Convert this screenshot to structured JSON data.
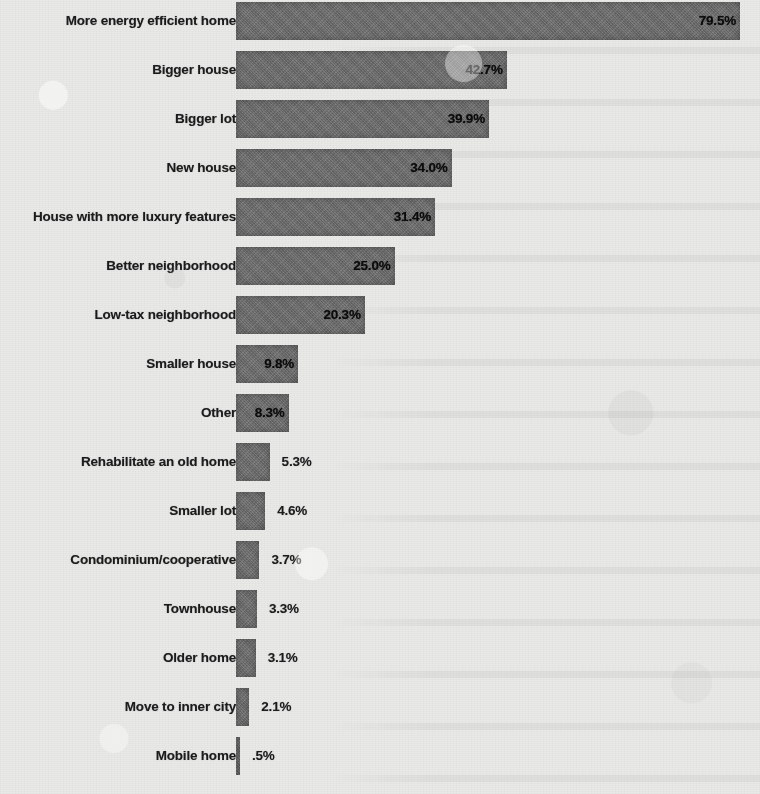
{
  "chart_data": {
    "type": "bar",
    "orientation": "horizontal",
    "title": "",
    "subtitle": "",
    "xlabel": "",
    "ylabel": "",
    "grid": false,
    "legend": null,
    "axis_visible": false,
    "value_suffix": "%",
    "xlim": [
      0,
      86
    ],
    "categories": [
      "More energy efficient home",
      "Bigger house",
      "Bigger lot",
      "New house",
      "House with more luxury features",
      "Better neighborhood",
      "Low-tax neighborhood",
      "Smaller house",
      "Other",
      "Rehabilitate an old home",
      "Smaller lot",
      "Condominium/cooperative",
      "Townhouse",
      "Older home",
      "Move to inner city",
      "Mobile home"
    ],
    "values": [
      79.5,
      42.7,
      39.9,
      34.0,
      31.4,
      25.0,
      20.3,
      9.8,
      8.3,
      5.3,
      4.6,
      3.7,
      3.3,
      3.1,
      2.1,
      0.5
    ],
    "value_labels": [
      "79.5%",
      "42.7%",
      "39.9%",
      "34.0%",
      "31.4%",
      "25.0%",
      "20.3%",
      "9.8%",
      "8.3%",
      "5.3%",
      "4.6%",
      "3.7%",
      "3.3%",
      "3.1%",
      "2.1%",
      ".5%"
    ],
    "label_placement": [
      "inside",
      "inside",
      "inside",
      "inside",
      "inside",
      "inside",
      "inside",
      "inside",
      "inside",
      "outside",
      "outside",
      "outside",
      "outside",
      "outside",
      "outside",
      "outside"
    ],
    "colors": {
      "bar_fill": "#6e6e6e",
      "background": "#e9e9e7",
      "label_text": "#1d1d1d",
      "value_text": "#0d0d0d"
    }
  },
  "rows": [
    {
      "label": "More energy efficient home",
      "value": 79.5,
      "value_label": "79.5%",
      "placement": "inside"
    },
    {
      "label": "Bigger house",
      "value": 42.7,
      "value_label": "42.7%",
      "placement": "inside"
    },
    {
      "label": "Bigger lot",
      "value": 39.9,
      "value_label": "39.9%",
      "placement": "inside"
    },
    {
      "label": "New house",
      "value": 34.0,
      "value_label": "34.0%",
      "placement": "inside"
    },
    {
      "label": "House with more luxury features",
      "value": 31.4,
      "value_label": "31.4%",
      "placement": "inside"
    },
    {
      "label": "Better neighborhood",
      "value": 25.0,
      "value_label": "25.0%",
      "placement": "inside"
    },
    {
      "label": "Low-tax neighborhood",
      "value": 20.3,
      "value_label": "20.3%",
      "placement": "inside"
    },
    {
      "label": "Smaller house",
      "value": 9.8,
      "value_label": "9.8%",
      "placement": "inside"
    },
    {
      "label": "Other",
      "value": 8.3,
      "value_label": "8.3%",
      "placement": "inside"
    },
    {
      "label": "Rehabilitate an old home",
      "value": 5.3,
      "value_label": "5.3%",
      "placement": "outside"
    },
    {
      "label": "Smaller lot",
      "value": 4.6,
      "value_label": "4.6%",
      "placement": "outside"
    },
    {
      "label": "Condominium/cooperative",
      "value": 3.7,
      "value_label": "3.7%",
      "placement": "outside"
    },
    {
      "label": "Townhouse",
      "value": 3.3,
      "value_label": "3.3%",
      "placement": "outside"
    },
    {
      "label": "Older home",
      "value": 3.1,
      "value_label": "3.1%",
      "placement": "outside"
    },
    {
      "label": "Move to inner city",
      "value": 2.1,
      "value_label": "2.1%",
      "placement": "outside"
    },
    {
      "label": "Mobile home",
      "value": 0.5,
      "value_label": ".5%",
      "placement": "outside"
    }
  ],
  "layout": {
    "bar_origin_x": 236,
    "px_per_unit": 6.34,
    "row_pitch": 49,
    "row_top_offset": 2,
    "bar_height": 38,
    "min_bar_width": 4
  }
}
